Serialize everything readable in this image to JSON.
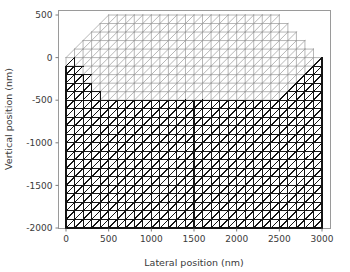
{
  "chart_data": {
    "type": "mesh",
    "title": "",
    "xlabel": "Lateral position (nm)",
    "ylabel": "Vertical position (nm)",
    "xlim": [
      -60,
      3070
    ],
    "ylim": [
      -2060,
      560
    ],
    "xticks": [
      0,
      500,
      1000,
      1500,
      2000,
      2500,
      3000
    ],
    "yticks": [
      500,
      0,
      -500,
      -1000,
      -1500,
      -2000
    ],
    "xtick_labels": [
      "0",
      "500",
      "1000",
      "1500",
      "2000",
      "2500",
      "3000"
    ],
    "ytick_labels": [
      "500",
      "0",
      "-500",
      "-1000",
      "-1500",
      "-2000"
    ],
    "grid": false,
    "legend": null,
    "cell_size_nm": 100,
    "regions": [
      {
        "name": "upper-island-region",
        "color": "#9d9d9d",
        "fill": "#ffffff",
        "polygon": [
          [
            0,
            0
          ],
          [
            500,
            500
          ],
          [
            2500,
            500
          ],
          [
            3000,
            0
          ],
          [
            2500,
            -500
          ],
          [
            500,
            -500
          ]
        ]
      },
      {
        "name": "lower-substrate-region",
        "color": "#141414",
        "fill": "#ffffff",
        "polygon": [
          [
            0,
            0
          ],
          [
            500,
            -500
          ],
          [
            2500,
            -500
          ],
          [
            3000,
            0
          ],
          [
            3000,
            -2000
          ],
          [
            0,
            -2000
          ]
        ]
      }
    ]
  },
  "axes": {
    "x_axis_title": "Lateral position (nm)",
    "y_axis_title": "Vertical position (nm)",
    "x_tick_values": [
      "0",
      "500",
      "1000",
      "1500",
      "2000",
      "2500",
      "3000"
    ],
    "y_tick_values": [
      "500",
      "0",
      "-500",
      "-1000",
      "-1500",
      "-2000"
    ]
  },
  "colors": {
    "background": "#ffffff",
    "frame": "#9a9a9a",
    "text": "#3a3a3a",
    "mesh_dark": "#141414",
    "mesh_light": "#9d9d9d"
  }
}
